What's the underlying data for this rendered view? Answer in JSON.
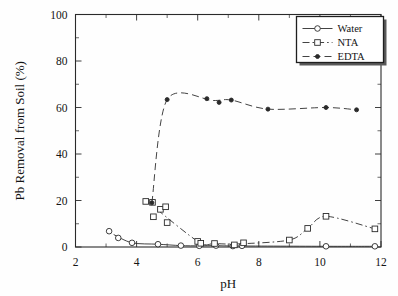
{
  "chart_data": {
    "type": "scatter",
    "title": "",
    "xlabel": "pH",
    "ylabel": "Pb Removal from Soil (%)",
    "xlim": [
      2,
      12
    ],
    "ylim": [
      0,
      100
    ],
    "xticks": [
      2,
      4,
      6,
      8,
      10,
      12
    ],
    "yticks": [
      0,
      20,
      40,
      60,
      80,
      100
    ],
    "xtick_labels": [
      "2",
      "4",
      "6",
      "8",
      "10",
      "12"
    ],
    "ytick_labels": [
      "0",
      "20",
      "40",
      "60",
      "80",
      "100"
    ],
    "grid": false,
    "legend_position": "top-right",
    "series": [
      {
        "name": "Water",
        "marker": "open-circle",
        "line_style": "solid",
        "points": [
          [
            3.1,
            6.8
          ],
          [
            3.4,
            3.9
          ],
          [
            3.85,
            1.8
          ],
          [
            4.7,
            1.2
          ],
          [
            5.45,
            0.6
          ],
          [
            6.05,
            0.5
          ],
          [
            6.6,
            0.6
          ],
          [
            7.15,
            0.4
          ],
          [
            7.45,
            0.5
          ],
          [
            10.2,
            0.3
          ],
          [
            11.8,
            0.3
          ]
        ]
      },
      {
        "name": "NTA",
        "marker": "open-square",
        "line_style": "dash-dot",
        "points": [
          [
            4.3,
            19.6
          ],
          [
            4.52,
            19.2
          ],
          [
            4.55,
            13.0
          ],
          [
            4.78,
            16.2
          ],
          [
            4.95,
            17.3
          ],
          [
            5.0,
            10.5
          ],
          [
            6.0,
            2.4
          ],
          [
            6.1,
            1.6
          ],
          [
            6.55,
            1.5
          ],
          [
            7.2,
            0.9
          ],
          [
            7.5,
            1.8
          ],
          [
            9.0,
            3.0
          ],
          [
            9.6,
            8.0
          ],
          [
            10.2,
            13.2
          ],
          [
            11.8,
            7.8
          ]
        ]
      },
      {
        "name": "EDTA",
        "marker": "filled-circle",
        "line_style": "dashed",
        "points": [
          [
            4.5,
            19.0
          ],
          [
            5.0,
            63.4
          ],
          [
            6.3,
            63.8
          ],
          [
            6.7,
            62.2
          ],
          [
            7.1,
            63.2
          ],
          [
            8.3,
            59.3
          ],
          [
            10.2,
            60.0
          ],
          [
            11.2,
            59.0
          ]
        ]
      }
    ]
  },
  "legend": {
    "entries": [
      {
        "label": "Water",
        "marker": "open-circle",
        "line_style": "solid"
      },
      {
        "label": "NTA",
        "marker": "open-square",
        "line_style": "dash-dot"
      },
      {
        "label": "EDTA",
        "marker": "filled-circle",
        "line_style": "dashed"
      }
    ]
  },
  "icons": {
    "water_marker": "circle-marker-icon",
    "nta_marker": "square-marker-icon",
    "edta_marker": "filled-circle-marker-icon"
  },
  "colors": {
    "axis": "#2a2a2a",
    "text": "#141414",
    "background": "#fefefe",
    "marker_fill": "#ffffff",
    "marker_stroke": "#2a2a2a"
  }
}
